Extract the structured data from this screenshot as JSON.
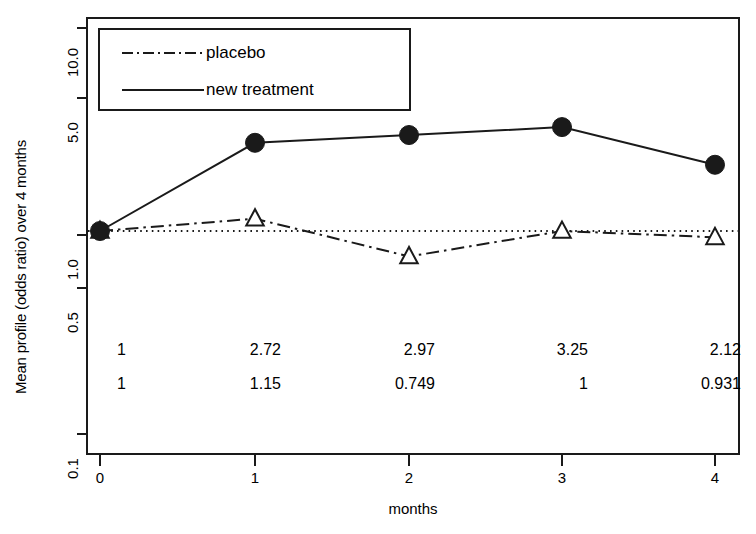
{
  "chart_data": {
    "type": "line",
    "title": "",
    "xlabel": "months",
    "ylabel": "Mean profile (odds ratio) over 4 months",
    "x": [
      0,
      1,
      2,
      3,
      4
    ],
    "xtick_labels": [
      "0",
      "1",
      "2",
      "3",
      "4"
    ],
    "ytick_values": [
      10.0,
      5.0,
      1.0,
      0.5,
      0.1
    ],
    "ytick_labels": [
      "10.0",
      "5.0",
      "1.0",
      "0.5",
      "0.1"
    ],
    "yscale": "log",
    "ylim": [
      0.1,
      10.0
    ],
    "xlim": [
      -0.3,
      4.3
    ],
    "grid": false,
    "legend_position": "top-left",
    "reference_line": {
      "name": "odds-ratio-unity-line",
      "value": 1.0,
      "style": "dotted",
      "color": "#1a1a1a"
    },
    "series": [
      {
        "name": "placebo",
        "legend_label": "placebo",
        "marker": "open-triangle",
        "linestyle": "dashdot",
        "color": "#1a1a1a",
        "values": [
          1,
          1.15,
          0.749,
          1,
          0.931
        ],
        "value_labels": [
          "1",
          "1.15",
          "0.749",
          "1",
          "0.931"
        ]
      },
      {
        "name": "new treatment",
        "legend_label": "new treatment",
        "marker": "filled-circle",
        "linestyle": "solid",
        "color": "#1a1a1a",
        "values": [
          1,
          2.72,
          2.97,
          3.25,
          2.12
        ],
        "value_labels": [
          "1",
          "2.72",
          "2.97",
          "3.25",
          "2.12"
        ]
      }
    ],
    "annotation_rows": [
      {
        "name": "new-treatment-values",
        "labels": [
          "1",
          "2.72",
          "2.97",
          "3.25",
          "2.12"
        ]
      },
      {
        "name": "placebo-values",
        "labels": [
          "1",
          "1.15",
          "0.749",
          "1",
          "0.931"
        ]
      }
    ]
  },
  "axes": {
    "y_title": "Mean profile (odds ratio) over 4 months",
    "x_title": "months"
  },
  "legend": {
    "entries": [
      {
        "label": "placebo",
        "style": "dashdot"
      },
      {
        "label": "new treatment",
        "style": "solid"
      }
    ]
  },
  "colors": {
    "foreground": "#1a1a1a",
    "background": "#ffffff"
  }
}
